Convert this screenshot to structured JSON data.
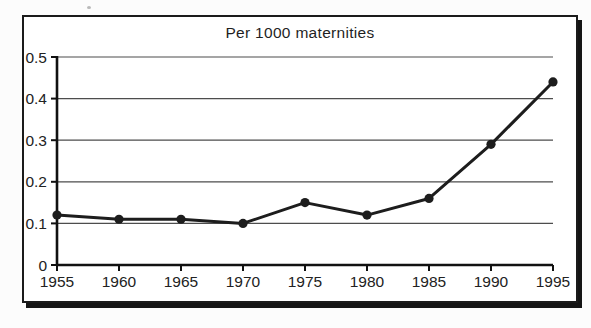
{
  "figure": {
    "title": "Per 1000 maternities"
  },
  "chart_data": {
    "type": "line",
    "title": "Per 1000 maternities",
    "xlabel": "",
    "ylabel": "",
    "x_tick_labels": [
      "1955",
      "1960",
      "1965",
      "1970",
      "1975",
      "1980",
      "1985",
      "1990",
      "1995"
    ],
    "y_tick_labels": [
      "0",
      "0.1",
      "0.2",
      "0.3",
      "0.4",
      "0.5"
    ],
    "series": [
      {
        "name": "rate-per-1000-maternities",
        "x": [
          1955,
          1960,
          1965,
          1970,
          1975,
          1980,
          1985,
          1990,
          1995
        ],
        "values": [
          0.12,
          0.11,
          0.11,
          0.1,
          0.15,
          0.12,
          0.16,
          0.29,
          0.44
        ]
      }
    ],
    "ylim": [
      0,
      0.5
    ],
    "xlim": [
      1955,
      1995
    ],
    "grid": "horizontal",
    "legend": "none",
    "line_color": "#1d1d1d",
    "grid_color": "#4d4d4d",
    "axis_color": "#111111",
    "marker": "filled-circle"
  }
}
